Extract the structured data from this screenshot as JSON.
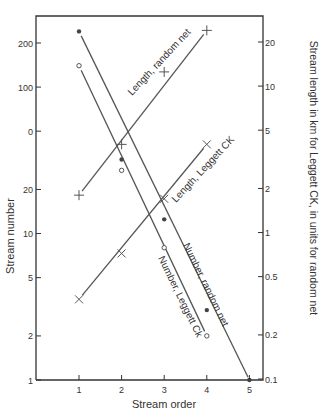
{
  "chart_data": {
    "type": "line",
    "title": "",
    "xlabel": "Stream order",
    "ylabel": "Stream number",
    "y2label": "Stream length in km for Leggett CK, in units for random net",
    "x": [
      1,
      2,
      3,
      4,
      5
    ],
    "x_ticks": [
      "1",
      "2",
      "3",
      "4",
      "5"
    ],
    "y_scale": "log",
    "y_ticks": [
      "200",
      "100",
      "0",
      "20",
      "10",
      "5",
      "2",
      "1"
    ],
    "y_tick_values": [
      200,
      100,
      50,
      20,
      10,
      5,
      2,
      1
    ],
    "ylim": [
      1,
      300
    ],
    "y2_scale": "log",
    "y2_ticks": [
      "20",
      "10",
      "5",
      "2",
      "1",
      "0.5",
      "0.2",
      "0.1"
    ],
    "y2_tick_values": [
      20,
      10,
      5,
      2,
      1,
      0.5,
      0.2,
      0.1
    ],
    "y2lim": [
      0.1,
      30
    ],
    "grid": false,
    "legend": "inline labels",
    "series": [
      {
        "name": "Number, random net",
        "axis": "left",
        "marker": "filled-dot",
        "x": [
          1,
          2,
          3,
          4,
          5
        ],
        "values": [
          240,
          32,
          12.5,
          3,
          1
        ]
      },
      {
        "name": "Number, Leggett Ck",
        "axis": "left",
        "marker": "open-circle",
        "x": [
          1,
          2,
          3,
          4
        ],
        "values": [
          140,
          27,
          8,
          2
        ]
      },
      {
        "name": "Length, random net",
        "axis": "right",
        "marker": "plus",
        "x": [
          1,
          2,
          3,
          4
        ],
        "values": [
          1.8,
          4,
          12.5,
          24
        ]
      },
      {
        "name": "Length, Leggett CK",
        "axis": "right",
        "marker": "cross",
        "x": [
          1,
          2,
          3,
          4
        ],
        "values": [
          0.35,
          0.72,
          1.7,
          4
        ]
      }
    ]
  },
  "labels": {
    "xlabel": "Stream order",
    "ylabel": "Stream number",
    "y2label": "Stream length in km for Leggett CK, in units for random net",
    "series_labels": [
      "Length, random net",
      "Length, Leggett CK",
      "Number, random net",
      "Number, Leggett Ck"
    ]
  }
}
